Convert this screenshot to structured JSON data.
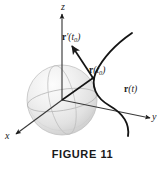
{
  "figure": {
    "caption": "FIGURE 11",
    "background_color": "#ffffff",
    "ink_color": "#1a1a1a",
    "axes": {
      "z_label": "z",
      "y_label": "y",
      "x_label": "x"
    },
    "labels": {
      "tangent_vector": {
        "vector_name": "r",
        "prime": "′",
        "open_paren": "(",
        "arg": "t",
        "subscript": "0",
        "close_paren": ")",
        "plain_text": "r′(t₀)"
      },
      "position_vector": {
        "vector_name": "r",
        "open_paren": "(",
        "arg": "t",
        "subscript": "0",
        "close_paren": ")",
        "plain_text": "r(t₀)"
      },
      "curve": {
        "vector_name": "r",
        "open_paren": "(",
        "arg": "t",
        "close_paren": ")",
        "plain_text": "r(t)"
      }
    },
    "sphere": {
      "fill_light": "#fbfbfb",
      "fill_mid": "#ececec",
      "fill_dark": "#cfcfcf",
      "outline_color": "#b4b4b4"
    }
  }
}
